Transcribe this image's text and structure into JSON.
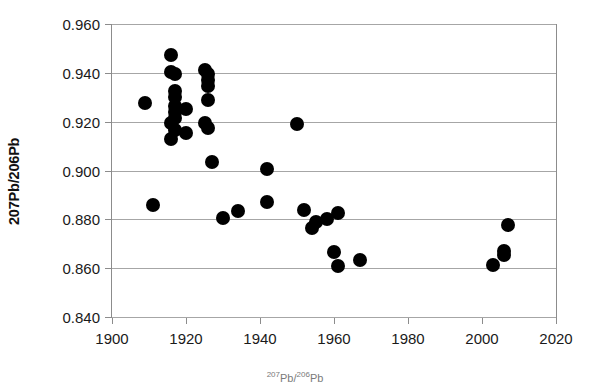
{
  "chart_data": {
    "type": "scatter",
    "title": "",
    "xlabel": "",
    "ylabel": "207Pb/206Pb",
    "xlim": [
      1900,
      2020
    ],
    "ylim": [
      0.84,
      0.96
    ],
    "xticks": [
      1900,
      1920,
      1940,
      1960,
      1980,
      2000,
      2020
    ],
    "xtick_labels": [
      "1900",
      "1920",
      "1940",
      "1960",
      "1980",
      "2000",
      "2020"
    ],
    "yticks": [
      0.84,
      0.86,
      0.88,
      0.9,
      0.92,
      0.94,
      0.96
    ],
    "ytick_labels": [
      "0.840",
      "0.860",
      "0.880",
      "0.900",
      "0.920",
      "0.940",
      "0.960"
    ],
    "grid": true,
    "grid_axis": "y",
    "legend": false,
    "marker": "circle",
    "marker_color": "#000000",
    "marker_size": 14,
    "series": [
      {
        "name": "207Pb/206Pb ratio",
        "points": [
          [
            1909,
            0.9275
          ],
          [
            1916,
            0.9475
          ],
          [
            1916,
            0.9405
          ],
          [
            1917,
            0.9395
          ],
          [
            1917,
            0.9325
          ],
          [
            1917,
            0.93
          ],
          [
            1917,
            0.9265
          ],
          [
            1917,
            0.924
          ],
          [
            1917,
            0.9215
          ],
          [
            1916,
            0.9195
          ],
          [
            1917,
            0.9165
          ],
          [
            1916,
            0.913
          ],
          [
            1920,
            0.925
          ],
          [
            1920,
            0.9155
          ],
          [
            1925,
            0.941
          ],
          [
            1926,
            0.9395
          ],
          [
            1926,
            0.937
          ],
          [
            1926,
            0.9345
          ],
          [
            1926,
            0.929
          ],
          [
            1925,
            0.9195
          ],
          [
            1926,
            0.9175
          ],
          [
            1911,
            0.886
          ],
          [
            1927,
            0.9035
          ],
          [
            1930,
            0.8805
          ],
          [
            1934,
            0.8835
          ],
          [
            1942,
            0.9005
          ],
          [
            1942,
            0.887
          ],
          [
            1950,
            0.919
          ],
          [
            1952,
            0.884
          ],
          [
            1954,
            0.8765
          ],
          [
            1955,
            0.879
          ],
          [
            1958,
            0.88
          ],
          [
            1961,
            0.8825
          ],
          [
            1960,
            0.8665
          ],
          [
            1961,
            0.861
          ],
          [
            1967,
            0.8635
          ],
          [
            2003,
            0.8615
          ],
          [
            2006,
            0.8655
          ],
          [
            2006,
            0.867
          ],
          [
            2007,
            0.8775
          ]
        ]
      }
    ]
  },
  "caption": {
    "text": "207Pb/206Pb"
  }
}
